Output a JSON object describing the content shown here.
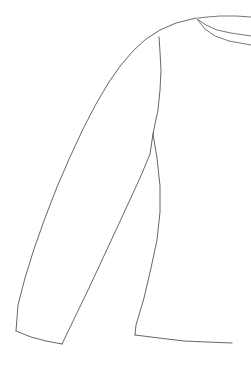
{
  "document": {
    "title": "Garment Technical Flat Sketch",
    "subject": "long-sleeve-top",
    "view": "partial front, left side",
    "background_color": "#ffffff",
    "line_color": "#555555",
    "line_weight": 0.9,
    "canvas": {
      "width": 251,
      "height": 366
    }
  },
  "drawing": {
    "style": "technical line drawing",
    "fill": "none",
    "parts": [
      {
        "name": "neckline-outer",
        "label": "Neckline outer edge",
        "points": "251,17 236,16 220,16 207,17 198,18"
      },
      {
        "name": "neckline-rib-mid",
        "label": "Neck ribbing middle line",
        "points": "197,19 206,25 217,30 231,33 251,36"
      },
      {
        "name": "neckline-rib-inner",
        "label": "Neck ribbing inner line",
        "points": "197,19 205,29 215,36 229,41 251,45"
      },
      {
        "name": "shoulder-seam",
        "label": "Shoulder / yoke top curve",
        "points": "196,18 176,23 160,30 146,39 133,51 121,65 109,82"
      },
      {
        "name": "sleeve-outer-edge",
        "label": "Sleeve outer (top) edge",
        "points": "109,82 96,104 83,129 70,157 57,187 45,218 34,249 25,278 18,305 16,331"
      },
      {
        "name": "cuff-bottom-edge",
        "label": "Cuff bottom edge",
        "points": "16,331 31,337 46,341 62,344"
      },
      {
        "name": "sleeve-under-edge",
        "label": "Sleeve underarm (inner) edge",
        "points": "62,344 75,317 89,288 103,258 116,230 128,204 140,178 150,154 153,134"
      },
      {
        "name": "armhole-raglan-seam",
        "label": "Armhole / raglan seam",
        "points": "159,37 160,52 161,70 160,90 158,110 155,124 153,134"
      },
      {
        "name": "body-side-seam",
        "label": "Body side seam",
        "points": "153,134 157,158 160,186 160,212 157,240 151,268 144,298 136,325 135,335"
      },
      {
        "name": "body-hem",
        "label": "Body bottom hem",
        "points": "135,335 159,338 184,341 207,342 232,343"
      }
    ]
  }
}
